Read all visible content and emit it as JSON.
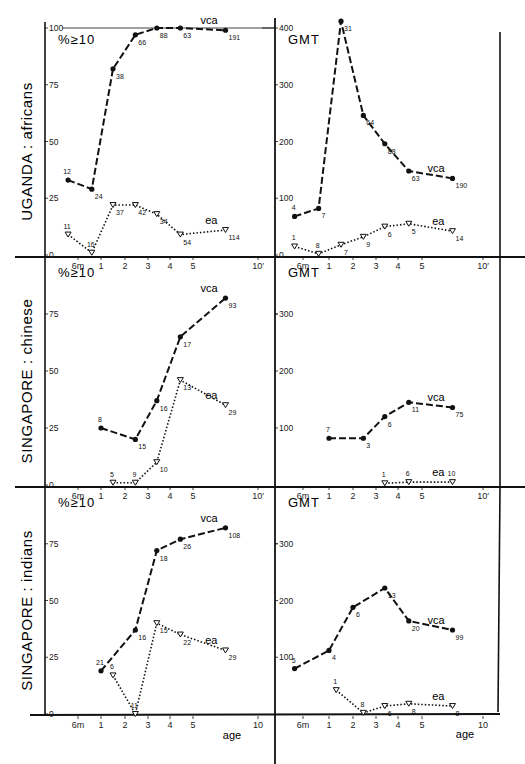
{
  "header": {
    "page_number": "",
    "running_title": "THE LOCAL... (cut off)"
  },
  "x_axis": {
    "label": "age",
    "tick_labels": [
      "6m",
      "1",
      "2",
      "3",
      "4",
      "5",
      "10"
    ],
    "tick_ages": [
      0.5,
      1,
      2,
      3,
      4,
      5,
      10
    ]
  },
  "layout": {
    "left_tick_x": [
      45,
      78,
      101,
      125,
      148,
      170,
      193,
      258
    ],
    "right_tick_x": [
      275,
      303,
      329,
      353,
      376,
      398,
      422,
      483
    ],
    "tick_age_pos": [
      0,
      0.5,
      1,
      2,
      3,
      4,
      5,
      10
    ]
  },
  "chart_data": [
    {
      "type": "line",
      "panel": "UGANDA: africans — %≥10",
      "row_label": "UGANDA : africans",
      "title": "%≥10",
      "xlabel": "age",
      "ylabel": "%≥10",
      "ylim": [
        0,
        100
      ],
      "yticks": [
        0,
        25,
        50,
        75,
        100
      ],
      "y0_px": 255,
      "ytop_px": 28,
      "side": "left",
      "series": [
        {
          "name": "vca",
          "style": "dashed",
          "marker": "dot",
          "x": [
            0.35,
            0.8,
            1.5,
            2.45,
            3.4,
            4.45,
            7.5
          ],
          "values": [
            33,
            29,
            82,
            97,
            100,
            100,
            99
          ],
          "n": [
            "12",
            "24",
            "38",
            "66",
            "88",
            "63",
            "191"
          ]
        },
        {
          "name": "ea",
          "style": "dotted",
          "marker": "triangle",
          "x": [
            0.35,
            0.8,
            1.5,
            2.45,
            3.4,
            4.45,
            7.5
          ],
          "values": [
            9,
            1,
            22,
            22,
            18,
            9,
            11
          ],
          "n": [
            "11",
            "16",
            "37",
            "42",
            "34",
            "54",
            "114"
          ]
        }
      ]
    },
    {
      "type": "line",
      "panel": "UGANDA: africans — GMT",
      "title": "GMT",
      "xlabel": "age",
      "ylabel": "GMT",
      "ylim": [
        0,
        400
      ],
      "yticks": [
        0,
        100,
        200,
        300,
        400
      ],
      "y0_px": 255,
      "ytop_px": 28,
      "side": "right",
      "series": [
        {
          "name": "vca",
          "style": "dashed",
          "marker": "dot",
          "x": [
            0.35,
            0.8,
            1.5,
            2.45,
            3.4,
            4.45,
            7.5
          ],
          "values": [
            68,
            82,
            412,
            246,
            196,
            148,
            135
          ],
          "n": [
            "4",
            "7",
            "31",
            "64",
            "88",
            "63",
            "190"
          ]
        },
        {
          "name": "ea",
          "style": "dotted",
          "marker": "triangle",
          "x": [
            0.35,
            0.8,
            1.5,
            2.45,
            3.4,
            4.45,
            7.5
          ],
          "values": [
            15,
            2,
            18,
            32,
            50,
            55,
            42
          ],
          "n": [
            "1",
            "8",
            "7",
            "9",
            "6",
            "5",
            "14"
          ]
        }
      ]
    },
    {
      "type": "line",
      "panel": "SINGAPORE: chinese — %≥10",
      "row_label": "SINGAPORE : chinese",
      "title": "%≥10",
      "xlabel": "age",
      "ylabel": "%≥10",
      "ylim": [
        0,
        100
      ],
      "yticks": [
        0,
        25,
        50,
        75
      ],
      "y0_px": 485,
      "ytop_px": 257,
      "side": "left",
      "series": [
        {
          "name": "vca",
          "style": "dashed",
          "marker": "dot",
          "x": [
            1,
            2.45,
            3.4,
            4.45,
            7.5
          ],
          "values": [
            25,
            20,
            37,
            65,
            82
          ],
          "n": [
            "8",
            "15",
            "16",
            "17",
            "93"
          ]
        },
        {
          "name": "ea",
          "style": "dotted",
          "marker": "triangle",
          "x": [
            1.5,
            2.45,
            3.4,
            4.45,
            7.5
          ],
          "values": [
            1,
            1,
            10,
            46,
            35
          ],
          "n": [
            "5",
            "9",
            "10",
            "13",
            "29"
          ]
        }
      ]
    },
    {
      "type": "line",
      "panel": "SINGAPORE: chinese — GMT",
      "title": "GMT",
      "xlabel": "age",
      "ylabel": "GMT",
      "ylim": [
        0,
        400
      ],
      "yticks": [
        100,
        200,
        300
      ],
      "y0_px": 485,
      "ytop_px": 257,
      "side": "right",
      "series": [
        {
          "name": "vca",
          "style": "dashed",
          "marker": "dot",
          "x": [
            1,
            2.45,
            3.4,
            4.45,
            7.5
          ],
          "values": [
            82,
            82,
            120,
            145,
            136
          ],
          "n": [
            "7",
            "3",
            "6",
            "11",
            "75"
          ]
        },
        {
          "name": "ea",
          "style": "dotted",
          "marker": "triangle",
          "x": [
            3.4,
            4.45,
            7.5
          ],
          "values": [
            3,
            5,
            5
          ],
          "n": [
            "1",
            "6",
            "10"
          ]
        }
      ]
    },
    {
      "type": "line",
      "panel": "SINGAPORE: indians — %≥10",
      "row_label": "SINGAPORE : indians",
      "title": "%≥10",
      "xlabel": "age",
      "ylabel": "%≥10",
      "ylim": [
        0,
        100
      ],
      "yticks": [
        0,
        25,
        50,
        75
      ],
      "y0_px": 714,
      "ytop_px": 487,
      "side": "left",
      "series": [
        {
          "name": "vca",
          "style": "dashed",
          "marker": "dot",
          "x": [
            1,
            2.45,
            3.4,
            4.45,
            7.5
          ],
          "values": [
            19,
            37,
            72,
            77,
            82
          ],
          "n": [
            "21",
            "16",
            "18",
            "26",
            "108"
          ]
        },
        {
          "name": "ea",
          "style": "dotted",
          "marker": "triangle",
          "x": [
            1.5,
            2.45,
            3.4,
            4.45,
            7.5
          ],
          "values": [
            17,
            0,
            40,
            35,
            28
          ],
          "n": [
            "6",
            "11",
            "15",
            "22",
            "29"
          ]
        }
      ]
    },
    {
      "type": "line",
      "panel": "SINGAPORE: indians — GMT",
      "title": "GMT",
      "xlabel": "age",
      "ylabel": "GMT",
      "ylim": [
        0,
        400
      ],
      "yticks": [
        100,
        200,
        300
      ],
      "y0_px": 714,
      "ytop_px": 487,
      "side": "right",
      "series": [
        {
          "name": "vca",
          "style": "dashed",
          "marker": "dot",
          "x": [
            0.35,
            1,
            2,
            3.4,
            4.45,
            7.5
          ],
          "values": [
            80,
            112,
            188,
            222,
            164,
            148
          ],
          "n": [
            "5",
            "4",
            "6",
            "13",
            "20",
            "99"
          ]
        },
        {
          "name": "ea",
          "style": "dotted",
          "marker": "triangle",
          "x": [
            1.3,
            2.45,
            3.4,
            4.45,
            7.5
          ],
          "values": [
            42,
            2,
            14,
            18,
            14
          ],
          "n": [
            "1",
            "8",
            "6",
            "8",
            "8"
          ]
        }
      ]
    }
  ]
}
